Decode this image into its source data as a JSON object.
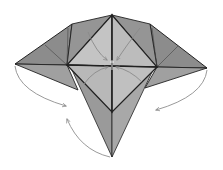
{
  "diagram": {
    "type": "origami-folding-step",
    "colors": {
      "background": "#ffffff",
      "dark_paper": "#8a8a8a",
      "mid_paper": "#a6a6a6",
      "light_paper": "#c8c8c8",
      "outline": "#222222",
      "arrow": "#9a9a9a"
    },
    "arrows": [
      {
        "name": "left-tip-fold-arrow",
        "direction": "down-right"
      },
      {
        "name": "right-tip-fold-arrow",
        "direction": "down-left"
      },
      {
        "name": "bottom-point-fold-arrow",
        "direction": "up-left"
      },
      {
        "name": "center-top-left-arrow",
        "direction": "toward-center"
      },
      {
        "name": "center-top-right-arrow",
        "direction": "toward-center"
      },
      {
        "name": "center-bottom-left-arrow",
        "direction": "toward-center"
      },
      {
        "name": "center-bottom-right-arrow",
        "direction": "toward-center"
      }
    ]
  }
}
